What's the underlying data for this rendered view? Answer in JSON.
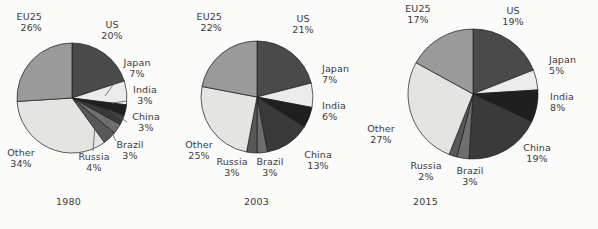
{
  "figure": {
    "background_color": "#fbfbfa",
    "text_color": "#3a3a3a",
    "slice_outline_color": "#1a1a1a"
  },
  "palette": {
    "US": "#4a4a4a",
    "Japan": "#ececea",
    "India": "#1f1f1f",
    "China": "#3a3a3a",
    "Brazil": "#6e6e6e",
    "Russia": "#585858",
    "Other": "#e4e4e1",
    "EU25": "#9a9a9a"
  },
  "chart_data": [
    {
      "type": "pie",
      "title": "1980",
      "start_angle_deg": 0,
      "direction": "clockwise",
      "categories": [
        "US",
        "Japan",
        "India",
        "China",
        "Brazil",
        "Russia",
        "Other",
        "EU25"
      ],
      "values": [
        20,
        7,
        3,
        3,
        3,
        4,
        34,
        26
      ],
      "labels": [
        {
          "name": "US",
          "pct": "20%"
        },
        {
          "name": "Japan",
          "pct": "7%"
        },
        {
          "name": "India",
          "pct": "3%"
        },
        {
          "name": "China",
          "pct": "3%"
        },
        {
          "name": "Brazil",
          "pct": "3%"
        },
        {
          "name": "Russia",
          "pct": "4%"
        },
        {
          "name": "Other",
          "pct": "34%"
        },
        {
          "name": "EU25",
          "pct": "26%"
        }
      ]
    },
    {
      "type": "pie",
      "title": "2003",
      "start_angle_deg": 0,
      "direction": "clockwise",
      "categories": [
        "US",
        "Japan",
        "India",
        "China",
        "Brazil",
        "Russia",
        "Other",
        "EU25"
      ],
      "values": [
        21,
        7,
        6,
        13,
        3,
        3,
        25,
        22
      ],
      "labels": [
        {
          "name": "US",
          "pct": "21%"
        },
        {
          "name": "Japan",
          "pct": "7%"
        },
        {
          "name": "India",
          "pct": "6%"
        },
        {
          "name": "China",
          "pct": "13%"
        },
        {
          "name": "Brazil",
          "pct": "3%"
        },
        {
          "name": "Russia",
          "pct": "3%"
        },
        {
          "name": "Other",
          "pct": "25%"
        },
        {
          "name": "EU25",
          "pct": "22%"
        }
      ]
    },
    {
      "type": "pie",
      "title": "2015",
      "start_angle_deg": 0,
      "direction": "clockwise",
      "categories": [
        "US",
        "Japan",
        "India",
        "China",
        "Brazil",
        "Russia",
        "Other",
        "EU25"
      ],
      "values": [
        19,
        5,
        8,
        19,
        3,
        2,
        27,
        17
      ],
      "labels": [
        {
          "name": "US",
          "pct": "19%"
        },
        {
          "name": "Japan",
          "pct": "5%"
        },
        {
          "name": "India",
          "pct": "8%"
        },
        {
          "name": "China",
          "pct": "19%"
        },
        {
          "name": "Brazil",
          "pct": "3%"
        },
        {
          "name": "Russia",
          "pct": "2%"
        },
        {
          "name": "Other",
          "pct": "27%"
        },
        {
          "name": "EU25",
          "pct": "17%"
        }
      ]
    }
  ],
  "years": [
    "1980",
    "2003",
    "2015"
  ]
}
